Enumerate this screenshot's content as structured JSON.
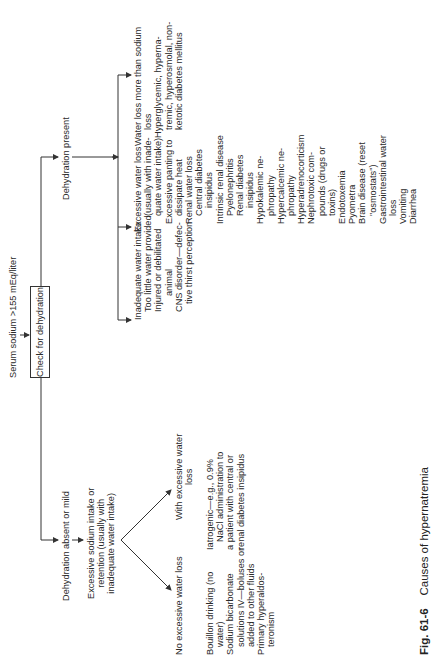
{
  "figure": {
    "number": "Fig. 61-6",
    "title": "Causes of hypernatremia"
  },
  "root": {
    "condition": "Serum sodium >155 mEq/liter",
    "action": "Check for dehydration"
  },
  "branch_absent": {
    "label": "Dehydration absent or mild",
    "cause": [
      "Excessive sodium intake or",
      "retention (usually with",
      "inadequate water intake)"
    ],
    "no_excess_loss": {
      "label": "No excessive water loss",
      "items": [
        {
          "text": "Bouillon drinking (no",
          "indent": 0
        },
        {
          "text": "water)",
          "indent": 1
        },
        {
          "text": "Sodium bicarbonate",
          "indent": 0
        },
        {
          "text": "solutions IV—boluses or",
          "indent": 1
        },
        {
          "text": "added to other fluids",
          "indent": 1
        },
        {
          "text": "Primary hyperaldos-",
          "indent": 0
        },
        {
          "text": "teronism",
          "indent": 1
        }
      ]
    },
    "with_excess_loss": {
      "label_lines": [
        "With excessive water",
        "loss"
      ],
      "items": [
        {
          "text": "Iatrogenic—e.g., 0.9%",
          "indent": 0
        },
        {
          "text": "NaCl administration to",
          "indent": 1
        },
        {
          "text": "a patient with central or",
          "indent": 0
        },
        {
          "text": "renal diabetes insipidus",
          "indent": 0
        }
      ]
    }
  },
  "branch_present": {
    "label": "Dehydration present",
    "inadequate_intake": {
      "items": [
        {
          "text": "Inadequate water intake",
          "indent": 0
        },
        {
          "text": "Too little water provided",
          "indent": 1
        },
        {
          "text": "Injured or debilitated",
          "indent": 1
        },
        {
          "text": "animal",
          "indent": 3
        },
        {
          "text": "CNS disorder—defec-",
          "indent": 1
        },
        {
          "text": "tive thirst perception",
          "indent": 2
        }
      ]
    },
    "excessive_loss": {
      "items": [
        {
          "text": "Excessive water loss",
          "indent": 0
        },
        {
          "text": "(usually with inade-",
          "indent": 2
        },
        {
          "text": "quate water intake)",
          "indent": 2
        },
        {
          "text": "Excessive panting to",
          "indent": 1
        },
        {
          "text": "dissipate heat",
          "indent": 2
        },
        {
          "text": "Renal water loss",
          "indent": 1
        },
        {
          "text": "Central diabetes",
          "indent": 2
        },
        {
          "text": "insipidus",
          "indent": 3
        },
        {
          "text": "Intrinsic renal disease",
          "indent": 1
        },
        {
          "text": "Pyelonephritis",
          "indent": 2
        },
        {
          "text": "Renal diabetes",
          "indent": 2
        },
        {
          "text": "insipidus",
          "indent": 3
        },
        {
          "text": "Hypokalemic ne-",
          "indent": 1
        },
        {
          "text": "phropathy",
          "indent": 2
        },
        {
          "text": "Hypercalcemic ne-",
          "indent": 1
        },
        {
          "text": "phropathy",
          "indent": 2
        },
        {
          "text": "Hyperadrenocorticism",
          "indent": 1
        },
        {
          "text": "Nephrotoxic com-",
          "indent": 1
        },
        {
          "text": "pounds (drugs or",
          "indent": 2
        },
        {
          "text": "toxins)",
          "indent": 2
        },
        {
          "text": "Endotoxemia",
          "indent": 1
        },
        {
          "text": "Pyometra",
          "indent": 1
        },
        {
          "text": "Brain disease (reset",
          "indent": 1
        },
        {
          "text": "\"osmostats\")",
          "indent": 2
        },
        {
          "text": "Gastrointestinal water",
          "indent": 1
        },
        {
          "text": "loss",
          "indent": 2
        },
        {
          "text": "Vomiting",
          "indent": 1
        },
        {
          "text": "Diarrhea",
          "indent": 1
        }
      ]
    },
    "water_more_than_sodium": {
      "items": [
        {
          "text": "Water loss more than sodium",
          "indent": 0
        },
        {
          "text": "loss",
          "indent": 2
        },
        {
          "text": "Hyperglycemic, hyperna-",
          "indent": 1
        },
        {
          "text": "tremic, hyperosmolal, non-",
          "indent": 2
        },
        {
          "text": "ketotic diabetes mellitus",
          "indent": 2
        }
      ]
    }
  },
  "colors": {
    "ink": "#2a2a2a",
    "paper": "#ffffff"
  }
}
